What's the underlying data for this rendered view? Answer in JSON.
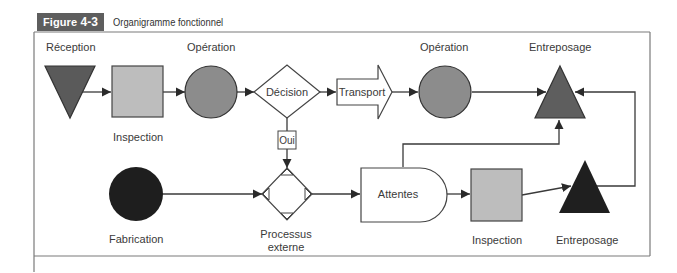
{
  "figure": {
    "tag_prefix": "Figure ",
    "tag_number": "4-3",
    "title": "Organigramme fonctionnel"
  },
  "colors": {
    "frame": "#7a7a7a",
    "line": "#3a3a3a",
    "reception_fill": "#5a5a5a",
    "inspection_fill": "#bdbdbd",
    "operation_fill": "#8c8c8c",
    "entreposage_top_fill": "#5e5e5e",
    "fabrication_fill": "#1e1e1e",
    "entreposage_bottom_fill": "#1f1f1f"
  },
  "nodes": {
    "reception": {
      "label": "Réception",
      "shape": "inverted-triangle"
    },
    "inspection_top": {
      "label": "Inspection",
      "shape": "square"
    },
    "operation_1": {
      "label": "Opération",
      "shape": "circle"
    },
    "decision": {
      "label": "Décision",
      "shape": "diamond"
    },
    "oui": {
      "label": "Oui"
    },
    "transport": {
      "label": "Transport",
      "shape": "arrow"
    },
    "operation_2": {
      "label": "Opération",
      "shape": "circle"
    },
    "entreposage_top": {
      "label": "Entreposage",
      "shape": "triangle"
    },
    "fabrication": {
      "label": "Fabrication",
      "shape": "circle"
    },
    "processus_externe": {
      "label_line1": "Processus",
      "label_line2": "externe",
      "shape": "diamond-with-corners"
    },
    "attentes": {
      "label": "Attentes",
      "shape": "delay"
    },
    "inspection_bottom": {
      "label": "Inspection",
      "shape": "square"
    },
    "entreposage_bottom": {
      "label": "Entreposage",
      "shape": "triangle"
    }
  }
}
